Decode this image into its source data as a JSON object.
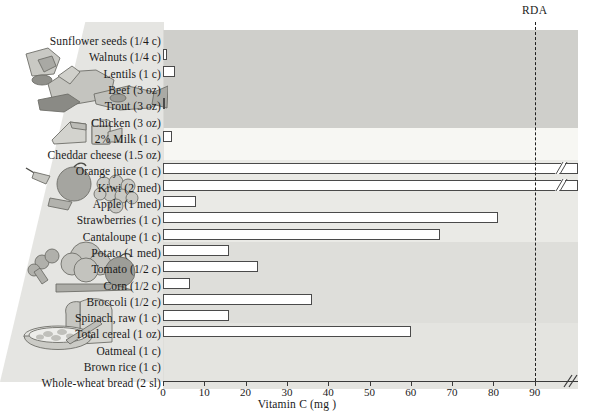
{
  "chart_data": {
    "type": "bar",
    "orientation": "horizontal",
    "title": "",
    "xlabel": "Vitamin C (mg )",
    "ylabel": "",
    "xlim": [
      0,
      90
    ],
    "xticks": [
      0,
      10,
      20,
      30,
      40,
      50,
      60,
      70,
      80,
      90
    ],
    "xtick_labels": [
      "0",
      "10",
      "20",
      "30",
      "40",
      "50",
      "60",
      "70",
      "80",
      "90"
    ],
    "grid": false,
    "legend": "none",
    "axis_break": true,
    "axis_break_note": "Axis is broken beyond 90 mg; Orange juice and Kiwi bars are drawn off-scale with break marks.",
    "annotations": [
      {
        "name": "rda-line",
        "label": "RDA",
        "value": 90
      }
    ],
    "categories": [
      "Sunflower seeds (1/4 c)",
      "Walnuts (1/4 c)",
      "Lentils (1 c)",
      "Beef (3 oz)",
      "Trout (3 oz)",
      "Chicken (3 oz)",
      "2% Milk (1 c)",
      "Cheddar cheese (1.5 oz)",
      "Orange juice (1 c)",
      "Kiwi (2 med)",
      "Apple (1 med)",
      "Strawberries (1 c)",
      "Cantaloupe (1 c)",
      "Potato (1 med)",
      "Tomato (1/2 c)",
      "Corn (1/2 c)",
      "Broccoli (1/2 c)",
      "Spinach, raw (1 c)",
      "Total cereal (1 oz)",
      "Oatmeal (1 c)",
      "Brown rice (1 c)",
      "Whole-wheat bread (2 sl)"
    ],
    "values": [
      0,
      1,
      3,
      0,
      0.5,
      0,
      2.3,
      0,
      99,
      99,
      8,
      81,
      67,
      16,
      23,
      6.5,
      36,
      16,
      60,
      0,
      0,
      0
    ],
    "offscale": [
      false,
      false,
      false,
      false,
      false,
      false,
      false,
      false,
      true,
      true,
      false,
      false,
      false,
      false,
      false,
      false,
      false,
      false,
      false,
      false,
      false,
      false
    ],
    "food_groups": [
      {
        "name": "nuts-legumes",
        "band_from": 0,
        "band_to": 5,
        "shade": "#cfcfcb"
      },
      {
        "name": "dairy",
        "band_from": 6,
        "band_to": 7,
        "shade": "#f7f7f3"
      },
      {
        "name": "fruits",
        "band_from": 8,
        "band_to": 12,
        "shade": "#eaeae6"
      },
      {
        "name": "vegetables",
        "band_from": 13,
        "band_to": 17,
        "shade": "#dedeDA"
      },
      {
        "name": "grains",
        "band_from": 18,
        "band_to": 21,
        "shade": "#e4e4e0"
      }
    ],
    "illustrations": [
      {
        "name": "nuts-meat-fish-illustration",
        "rows": "0-5"
      },
      {
        "name": "cheese-milk-illustration",
        "rows": "6-7"
      },
      {
        "name": "fruit-illustration",
        "rows": "8-12"
      },
      {
        "name": "vegetable-illustration",
        "rows": "13-17"
      },
      {
        "name": "cereal-bread-illustration",
        "rows": "18-21"
      }
    ]
  },
  "colors": {
    "bar_fill": "#ffffff",
    "bar_stroke": "#4a4a4a",
    "rda_line": "#1f1f1f",
    "axis": "#3a3a3a",
    "text": "#1a1a1a"
  }
}
